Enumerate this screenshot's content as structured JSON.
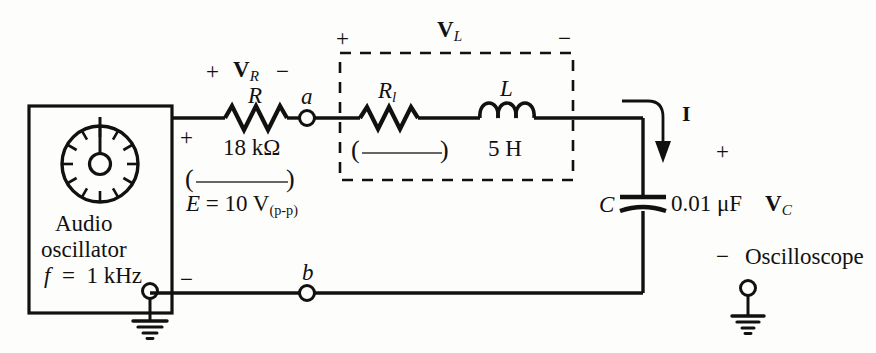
{
  "figure": {
    "ink_color": "#111111",
    "background_color": "#fdfdfb"
  },
  "source": {
    "box_label_line1": "Audio",
    "box_label_line2": "oscillator",
    "frequency_label": "f = 1 kHz",
    "frequency_symbol": "f",
    "frequency_value": "1 kHz",
    "emf_label": "E = 10 V",
    "emf_subscript": "(p-p)",
    "plus_terminal": "+",
    "minus_terminal": "−",
    "ground_name": "earth-ground"
  },
  "resistor_r": {
    "symbol": "R",
    "value": "18 kΩ",
    "voltage_symbol": "V",
    "voltage_subscript": "R",
    "polarity_plus": "+",
    "polarity_minus": "−",
    "blank_open": "(",
    "blank_close": ")"
  },
  "coil": {
    "box_voltage_symbol": "V",
    "box_voltage_subscript": "L",
    "box_polarity_plus": "+",
    "box_polarity_minus": "−",
    "resistance_symbol": "R",
    "resistance_subscript": "l",
    "blank_open": "(",
    "blank_close": ")",
    "inductance_symbol": "L",
    "inductance_value": "5 H"
  },
  "capacitor": {
    "symbol": "C",
    "value": "0.01 μF",
    "voltage_symbol": "V",
    "voltage_subscript": "C",
    "polarity_plus": "+",
    "polarity_minus": "−"
  },
  "current": {
    "label": "I"
  },
  "nodes": {
    "a": "a",
    "b": "b"
  },
  "instrument": {
    "label": "Oscilloscope",
    "ground_name": "earth-ground"
  }
}
